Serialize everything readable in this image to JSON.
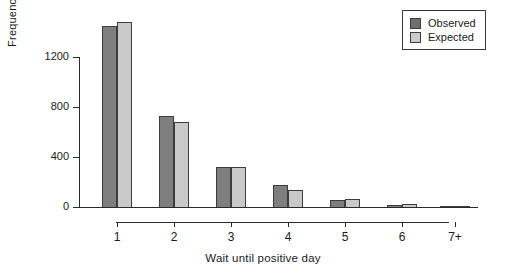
{
  "chart_data": {
    "type": "bar",
    "title": "",
    "xlabel": "Wait until positive day",
    "ylabel": "Frequency",
    "categories": [
      "1",
      "2",
      "3",
      "4",
      "5",
      "6",
      "7+"
    ],
    "series": [
      {
        "name": "Observed",
        "color": "#7e7e7e",
        "values": [
          1455,
          740,
          330,
          185,
          65,
          25,
          10
        ]
      },
      {
        "name": "Expected",
        "color": "#c9c9c9",
        "values": [
          1490,
          690,
          330,
          145,
          70,
          30,
          20
        ]
      }
    ],
    "ylim": [
      0,
      1550
    ],
    "yticks": [
      0,
      400,
      800,
      1200
    ],
    "ytick_labels": [
      "0",
      "400",
      "800",
      "1200"
    ],
    "grid": false,
    "legend_position": "top-right"
  },
  "legend": {
    "items": [
      {
        "label": "Observed",
        "swatch": "observed"
      },
      {
        "label": "Expected",
        "swatch": "expected"
      }
    ]
  }
}
